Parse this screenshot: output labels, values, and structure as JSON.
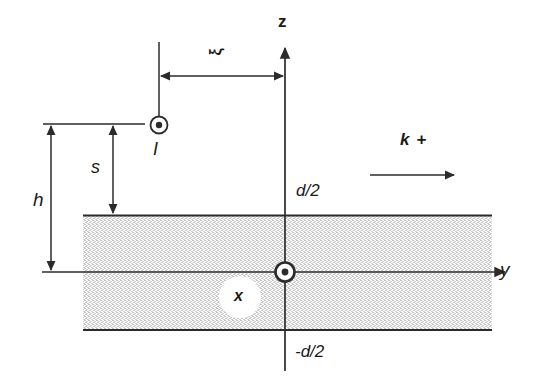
{
  "figure": {
    "background_color": "#ffffff",
    "line_color": "#2b2b2b",
    "slab_fill_color": "#d6d6d6",
    "label_color": "#1a1a1a"
  },
  "axes": {
    "vertical": {
      "name": "z-axis",
      "label": "z",
      "x": 285,
      "y_top": 45,
      "y_bottom": 371,
      "arrow": "up"
    },
    "horizontal": {
      "name": "y-axis",
      "label": "y",
      "y": 272,
      "x_left": 42,
      "x_right": 507,
      "arrow": "right"
    }
  },
  "slab": {
    "name": "dielectric-slab",
    "x_left": 83,
    "x_right": 492,
    "y_top": 215,
    "y_bottom": 330,
    "top_boundary_label": "d/2",
    "bottom_boundary_label": "-d/2"
  },
  "source": {
    "name": "line-current-source",
    "symbol": "out-of-page-current",
    "label": "I",
    "x": 159,
    "y": 125
  },
  "origin": {
    "name": "origin-marker",
    "symbol": "out-of-page-axis",
    "label": "x",
    "x": 285,
    "y": 272,
    "label_x": 240,
    "label_y": 297
  },
  "dimensions": [
    {
      "name": "xi-dimension",
      "label": "ξ",
      "orientation": "horizontal",
      "from_x": 159,
      "to_x": 285,
      "y": 76,
      "label_x": 218,
      "label_y": 52
    },
    {
      "name": "h-dimension",
      "label": "h",
      "orientation": "vertical",
      "x": 51,
      "from_y": 124,
      "to_y": 272,
      "label_x": 25,
      "label_y": 200
    },
    {
      "name": "s-dimension",
      "label": "s",
      "orientation": "vertical",
      "x": 113,
      "from_y": 124,
      "to_y": 215,
      "label_x": 90,
      "label_y": 168
    }
  ],
  "propagation": {
    "name": "propagation-direction",
    "label": "k +",
    "label_x": 415,
    "label_y": 142,
    "arrow_y": 175,
    "arrow_x_start": 370,
    "arrow_x_end": 456,
    "direction": "right"
  },
  "labels": {
    "z_axis": "z",
    "y_axis": "y",
    "x_axis": "x",
    "current": "I",
    "xi": "ξ",
    "h": "h",
    "s": "s",
    "d_half": "d/2",
    "minus_d_half": "-d/2",
    "k_plus": "k +"
  }
}
